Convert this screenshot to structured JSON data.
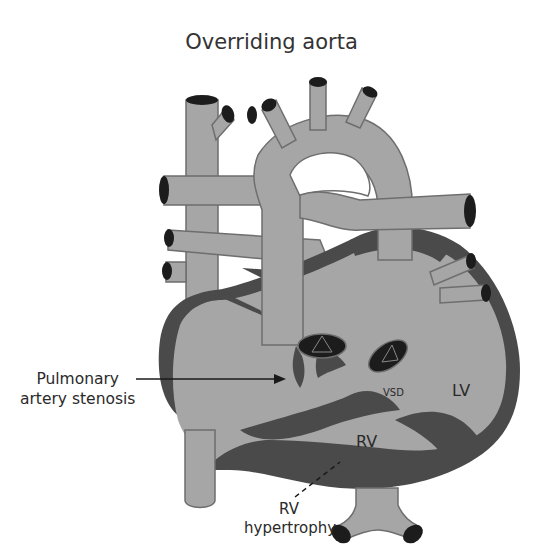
{
  "title": "Overriding aorta",
  "labels": {
    "pulmonary_stenosis": [
      "Pulmonary",
      "artery stenosis"
    ],
    "vsd": "VSD",
    "lv": "LV",
    "rv": "RV",
    "rv_hypertrophy": [
      "RV",
      "hypertrophy"
    ]
  },
  "colors": {
    "tissue": "#a6a6a6",
    "myocardium": "#4a4a4a",
    "vessel_lumen": "#1c1c1c",
    "outline": "#6e6e6e",
    "background": "#ffffff",
    "text": "#2a2a2a"
  }
}
